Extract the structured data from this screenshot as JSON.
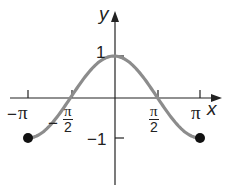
{
  "chart_data": {
    "type": "line",
    "function": "y = cos x",
    "title": "",
    "xlabel": "x",
    "ylabel": "y",
    "xlim": [
      -3.14159,
      3.14159
    ],
    "ylim": [
      -1,
      1
    ],
    "x_ticks": [
      {
        "value": -3.14159,
        "label": "−π"
      },
      {
        "value": -1.5708,
        "label": "−π/2"
      },
      {
        "value": 1.5708,
        "label": "π/2"
      },
      {
        "value": 3.14159,
        "label": "π"
      }
    ],
    "y_ticks": [
      {
        "value": 1,
        "label": "1"
      },
      {
        "value": -1,
        "label": "−1"
      }
    ],
    "series": [
      {
        "name": "cos x",
        "x": [
          -3.14159,
          -1.5708,
          0,
          1.5708,
          3.14159
        ],
        "y": [
          -1,
          0,
          1,
          0,
          -1
        ],
        "color": "#8c8c8c"
      }
    ],
    "endpoints": [
      {
        "x": -3.14159,
        "y": -1,
        "style": "closed"
      },
      {
        "x": 3.14159,
        "y": -1,
        "style": "closed"
      }
    ],
    "grid": false,
    "legend": "none"
  },
  "labels": {
    "x_axis": "x",
    "y_axis": "y",
    "neg_pi_sign": "−",
    "pi": "π",
    "neg_half_sign": "−",
    "half_num": "π",
    "half_den": "2",
    "y_one": "1",
    "y_neg_one": "−1"
  },
  "colors": {
    "axis": "#222222",
    "curve": "#8c8c8c",
    "point": "#111111"
  }
}
